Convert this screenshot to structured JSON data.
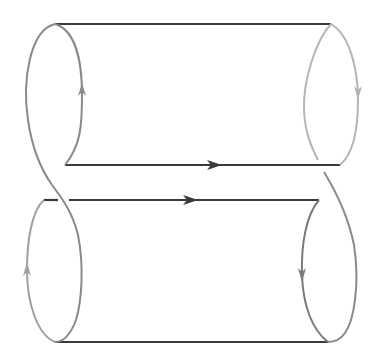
{
  "diagram": {
    "type": "twisted-cylinder-surface",
    "colors": {
      "background": "#ffffff",
      "edge_dark": "#3a3a3a",
      "edge_mid": "#8a8a8a",
      "edge_light": "#b5b5b5"
    },
    "arrows": [
      {
        "name": "top-left-circle-arrow",
        "direction": "up"
      },
      {
        "name": "top-right-circle-arrow",
        "direction": "down"
      },
      {
        "name": "middle-upper-line-arrow",
        "direction": "right"
      },
      {
        "name": "middle-lower-line-arrow",
        "direction": "right"
      },
      {
        "name": "bottom-left-circle-arrow",
        "direction": "up"
      },
      {
        "name": "bottom-right-circle-arrow",
        "direction": "down"
      }
    ]
  }
}
